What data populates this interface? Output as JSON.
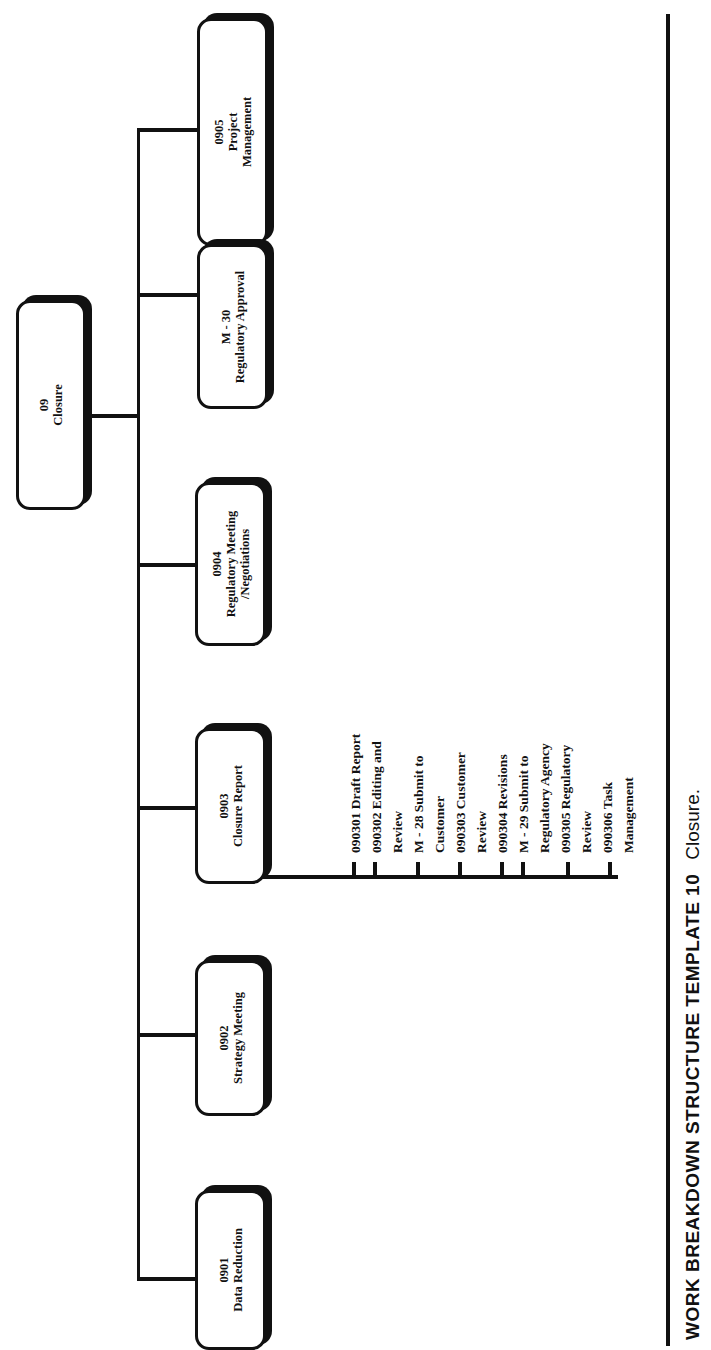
{
  "diagram": {
    "type": "work-breakdown-structure",
    "orientation": "rotated-90-ccw",
    "root": {
      "code": "09",
      "label": "Closure"
    },
    "children": [
      {
        "code": "0901",
        "label": "Data Reduction"
      },
      {
        "code": "0902",
        "label": "Strategy Meeting"
      },
      {
        "code": "0903",
        "label": "Closure Report",
        "subtasks": [
          "090301 Draft Report",
          "090302 Editing and",
          "Review",
          "M - 28 Submit to",
          "Customer",
          "090303 Customer",
          "Review",
          "090304 Revisions",
          "M - 29 Submit to",
          "Regulatory Agency",
          "090305 Regulatory",
          "Review",
          "090306 Task",
          "Management"
        ]
      },
      {
        "code": "0904",
        "label": "Regulatory Meeting",
        "label2": "/Negotiations"
      },
      {
        "code": "M - 30",
        "label": "Regulatory Approval"
      },
      {
        "code": "0905",
        "label": "Project",
        "label2": "Management"
      }
    ]
  },
  "caption": {
    "title": "WORK BREAKDOWN STRUCTURE TEMPLATE 10",
    "subtitle": "Closure."
  }
}
